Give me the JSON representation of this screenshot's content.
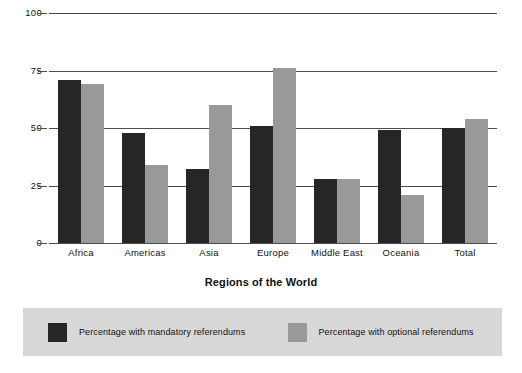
{
  "chart_data": {
    "type": "bar",
    "title": "",
    "subtitle": "",
    "xlabel": "Regions of the World",
    "ylabel": "",
    "ylim": [
      0,
      100
    ],
    "yticks": [
      0,
      25,
      50,
      75,
      100
    ],
    "ytick_labels": [
      "0",
      "25",
      "50",
      "75",
      "100"
    ],
    "grid": true,
    "grid_axis": "y",
    "legend_position": "bottom",
    "categories": [
      "Africa",
      "Americas",
      "Asia",
      "Europe",
      "Middle East",
      "Oceania",
      "Total"
    ],
    "series": [
      {
        "name": "Percentage with mandatory referendums",
        "color": "#262626",
        "values": [
          71,
          48,
          32,
          51,
          28,
          49,
          50
        ]
      },
      {
        "name": "Percentage with optional referendums",
        "color": "#999999",
        "values": [
          69,
          34,
          60,
          76,
          28,
          21,
          54
        ]
      }
    ]
  },
  "axis": {
    "y_tick_labels": [
      "100",
      "75",
      "50",
      "25",
      "0"
    ],
    "x_tick_labels": [
      "Africa",
      "Americas",
      "Asia",
      "Europe",
      "Middle East",
      "Oceania",
      "Total"
    ],
    "x_title": "Regions of the World"
  },
  "legend": {
    "items": [
      {
        "label": "Percentage with mandatory referendums",
        "color": "#262626"
      },
      {
        "label": "Percentage with optional referendums",
        "color": "#999999"
      }
    ],
    "background": "#d8d8d8"
  },
  "colors": {
    "mandatory": "#262626",
    "optional": "#999999",
    "axis": "#4d4d4d",
    "text": "#111111",
    "background": "#ffffff"
  }
}
